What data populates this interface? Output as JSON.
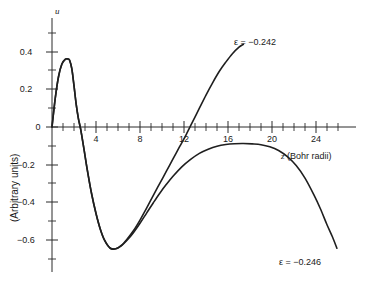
{
  "chart_data": {
    "type": "line",
    "title": "",
    "xlabel": "z (Bohr radii)",
    "xlabel_symbol": "z",
    "xlabel_unit": "(Bohr radii)",
    "ylabel": "(Arbitrary units)",
    "yaxis_symbol": "u",
    "xlim": [
      0,
      27.5
    ],
    "ylim": [
      -0.72,
      0.47
    ],
    "grid": false,
    "legend_position": "inline-at-curve-end",
    "x_ticks_major": [
      4,
      8,
      12,
      16,
      20,
      24
    ],
    "x_tick_labels": [
      "4",
      "8",
      "12",
      "16",
      "20",
      "24"
    ],
    "x_tick_minor_step": 1,
    "y_ticks_major": [
      0.4,
      0.2,
      0,
      -0.2,
      -0.4,
      -0.6
    ],
    "y_tick_labels": [
      "0.4",
      "0.2",
      "0",
      "−0.2",
      "−0.4",
      "−0.6"
    ],
    "y_tick_minor_step": 0.1,
    "series": [
      {
        "name": "ε = −0.242",
        "label": "ε = −0.242",
        "epsilon": -0.242,
        "color": "#1f1f1f",
        "x": [
          0.0,
          0.3,
          0.6,
          0.9,
          1.2,
          1.45,
          1.6,
          1.8,
          2.0,
          2.2,
          2.4,
          2.6,
          2.9,
          3.2,
          3.6,
          4.0,
          4.4,
          4.8,
          5.3,
          5.8,
          6.3,
          6.8,
          7.4,
          8.0,
          8.6,
          9.2,
          9.8,
          10.4,
          11.0,
          11.6,
          12.2,
          12.8,
          13.4,
          14.0,
          14.6,
          15.2,
          15.8,
          16.4,
          17.0,
          17.4
        ],
        "y": [
          0.0,
          0.155,
          0.27,
          0.335,
          0.36,
          0.362,
          0.355,
          0.31,
          0.22,
          0.12,
          0.045,
          -0.01,
          -0.115,
          -0.225,
          -0.355,
          -0.46,
          -0.545,
          -0.605,
          -0.645,
          -0.648,
          -0.63,
          -0.598,
          -0.552,
          -0.495,
          -0.432,
          -0.365,
          -0.3,
          -0.235,
          -0.17,
          -0.105,
          -0.04,
          0.03,
          0.1,
          0.17,
          0.235,
          0.295,
          0.345,
          0.39,
          0.425,
          0.44
        ]
      },
      {
        "name": "ε = −0.246",
        "label": "ε = −0.246",
        "epsilon": -0.246,
        "color": "#1f1f1f",
        "x": [
          0.0,
          0.3,
          0.6,
          0.9,
          1.2,
          1.45,
          1.6,
          1.8,
          2.0,
          2.2,
          2.4,
          2.6,
          2.9,
          3.2,
          3.6,
          4.0,
          4.4,
          4.8,
          5.3,
          5.8,
          6.3,
          6.8,
          7.4,
          8.0,
          8.6,
          9.2,
          9.8,
          10.4,
          11.0,
          11.8,
          12.6,
          13.4,
          14.2,
          15.0,
          15.8,
          16.6,
          17.4,
          18.2,
          19.0,
          19.8,
          20.6,
          21.4,
          22.2,
          23.0,
          23.8,
          24.4,
          25.0,
          25.5,
          25.9
        ],
        "y": [
          0.0,
          0.155,
          0.27,
          0.335,
          0.36,
          0.362,
          0.355,
          0.31,
          0.22,
          0.12,
          0.045,
          -0.01,
          -0.115,
          -0.225,
          -0.355,
          -0.46,
          -0.545,
          -0.605,
          -0.645,
          -0.648,
          -0.632,
          -0.604,
          -0.562,
          -0.512,
          -0.458,
          -0.404,
          -0.352,
          -0.305,
          -0.262,
          -0.212,
          -0.172,
          -0.14,
          -0.118,
          -0.102,
          -0.093,
          -0.089,
          -0.088,
          -0.09,
          -0.094,
          -0.105,
          -0.125,
          -0.158,
          -0.205,
          -0.272,
          -0.36,
          -0.435,
          -0.52,
          -0.585,
          -0.645
        ]
      }
    ],
    "annotations": [
      {
        "text": "ε = −0.242",
        "attached_to": "series-0",
        "position": "upper-right"
      },
      {
        "text": "ε = −0.246",
        "attached_to": "series-1",
        "position": "lower-right"
      }
    ]
  }
}
